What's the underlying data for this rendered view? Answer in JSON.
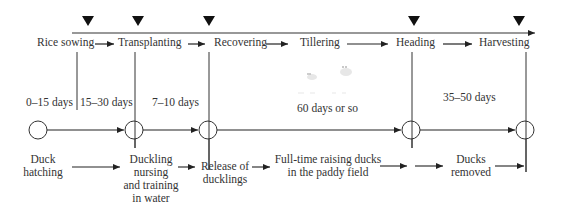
{
  "diagram": {
    "rice_stages": [
      {
        "label": "Rice sowing",
        "x": 37,
        "y": 37
      },
      {
        "label": "Transplanting",
        "x": 119,
        "y": 37
      },
      {
        "label": "Recovering",
        "x": 214,
        "y": 37
      },
      {
        "label": "Tillering",
        "x": 300,
        "y": 37
      },
      {
        "label": "Heading",
        "x": 396,
        "y": 37
      },
      {
        "label": "Harvesting",
        "x": 480,
        "y": 37
      }
    ],
    "durations": [
      {
        "label": "0–15 days",
        "x": 27,
        "y": 102
      },
      {
        "label": "15–30 days",
        "x": 80,
        "y": 102
      },
      {
        "label": "7–10 days",
        "x": 153,
        "y": 102
      },
      {
        "label": "60 days or so",
        "x": 297,
        "y": 108
      },
      {
        "label": "35–50 days",
        "x": 443,
        "y": 97
      }
    ],
    "duck_stages": [
      {
        "lines": [
          "Duck",
          "hatching"
        ],
        "x": 20,
        "y": 155,
        "w": 44
      },
      {
        "lines": [
          "Duckling",
          "nursing",
          "and training",
          "in water"
        ],
        "x": 120,
        "y": 155,
        "w": 64
      },
      {
        "lines": [
          "Release of",
          "ducklings"
        ],
        "x": 197,
        "y": 162,
        "w": 58
      },
      {
        "lines": [
          "Full-time raising ducks",
          "in the paddy field"
        ],
        "x": 273,
        "y": 155,
        "w": 134
      },
      {
        "lines": [
          "Ducks",
          "removed"
        ],
        "x": 447,
        "y": 155,
        "w": 52
      }
    ],
    "markers": {
      "triangle_x": [
        88,
        138,
        209,
        414,
        519
      ]
    },
    "colors": {
      "line": "#222222",
      "text": "#333333"
    }
  }
}
